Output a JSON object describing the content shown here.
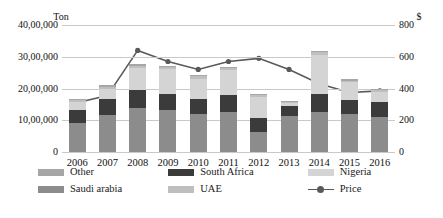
{
  "chart_data": {
    "type": "bar",
    "subtype": "stacked-bar-with-line",
    "title": "",
    "xlabel": "",
    "ylabel": "Ton",
    "y2label": "$",
    "grid": true,
    "legend_position": "bottom",
    "categories": [
      "2006",
      "2007",
      "2008",
      "2009",
      "2010",
      "2011",
      "2012",
      "2013",
      "2014",
      "2015",
      "2016"
    ],
    "yticks_left": [
      "0",
      "10,00,000",
      "20,00,000",
      "30,00,000",
      "40,00,000"
    ],
    "yticks_right": [
      "0",
      "200",
      "400",
      "600",
      "800"
    ],
    "ylim": [
      0,
      4000000
    ],
    "y2lim": [
      0,
      800
    ],
    "series": [
      {
        "name": "Saudi arabia",
        "color": "#8c8c8c",
        "values": [
          900000,
          1180000,
          1380000,
          1330000,
          1200000,
          1250000,
          620000,
          1120000,
          1270000,
          1200000,
          1100000
        ]
      },
      {
        "name": "South Africa",
        "color": "#3b3b3b",
        "values": [
          420000,
          480000,
          560000,
          500000,
          470000,
          560000,
          450000,
          340000,
          560000,
          430000,
          480000
        ]
      },
      {
        "name": "Nigeria",
        "color": "#d4d4d4",
        "values": [
          260000,
          330000,
          700000,
          780000,
          640000,
          760000,
          660000,
          90000,
          1240000,
          560000,
          300000
        ]
      },
      {
        "name": "UAE",
        "color": "#bfbfbf",
        "values": [
          60000,
          70000,
          80000,
          70000,
          70000,
          70000,
          60000,
          40000,
          70000,
          60000,
          60000
        ]
      },
      {
        "name": "Other",
        "color": "#a6a6a6",
        "values": [
          40000,
          40000,
          50000,
          40000,
          40000,
          40000,
          40000,
          30000,
          40000,
          40000,
          40000
        ]
      }
    ],
    "line_series": {
      "name": "Price",
      "color": "#595959",
      "values": [
        310,
        355,
        640,
        570,
        520,
        570,
        590,
        520,
        430,
        375,
        385
      ]
    }
  },
  "legend": {
    "row1": [
      {
        "label": "Other",
        "swatch": "#a6a6a6"
      },
      {
        "label": "South Africa",
        "swatch": "#3b3b3b"
      },
      {
        "label": "Nigeria",
        "swatch": "#d4d4d4"
      }
    ],
    "row2": [
      {
        "label": "Saudi arabia",
        "swatch": "#8c8c8c"
      },
      {
        "label": "UAE",
        "swatch": "#bfbfbf"
      },
      {
        "label": "Price",
        "swatch": "#595959",
        "marker": "line-marker-icon"
      }
    ]
  }
}
